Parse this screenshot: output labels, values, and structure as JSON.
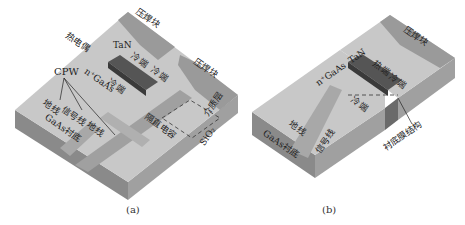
{
  "figure_a": {
    "caption": "(a)",
    "labels": {
      "pad_top": "压焊块",
      "pad_right": "压焊块",
      "thermocouple": "热电偶",
      "tan": "TaN",
      "cold_end_1": "冷端",
      "cold_end_2": "冷端",
      "cold_end_3": "冷端",
      "cpw": "CPW",
      "ngaas": "n⁺GaAs",
      "ground_1": "地线",
      "signal": "信号线",
      "ground_2": "地线",
      "substrate": "GaAs衬底",
      "dc_block": "隔直电容",
      "sio2": "SiO₂",
      "air_gap": "介质层"
    }
  },
  "figure_b": {
    "caption": "(b)",
    "labels": {
      "pad": "压焊块",
      "ngaas": "n⁺GaAs",
      "tan": "TaN",
      "hot_end": "热端",
      "cold_end_1": "冷端",
      "cold_end_2": "冷端",
      "ground": "地线",
      "signal": "信号线",
      "substrate": "GaAs衬底",
      "membrane": "衬底膜结构"
    }
  },
  "colors": {
    "top_surface": "#c8c8c8",
    "side_left": "#8a8a8a",
    "side_right": "#a0a0a0",
    "pad": "#9a9a9a",
    "lines": "#a8a8a8",
    "thermocouple": "#555555"
  }
}
